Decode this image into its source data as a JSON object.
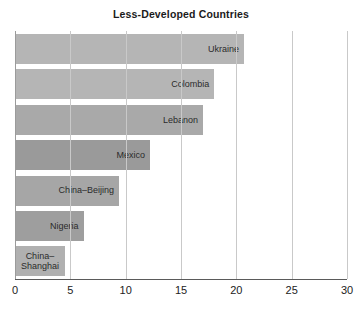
{
  "chart_data": {
    "type": "bar",
    "orientation": "horizontal",
    "title": "Less-Developed Countries",
    "xlabel": "",
    "ylabel": "",
    "xlim": [
      0,
      30
    ],
    "xticks": [
      0,
      5,
      10,
      15,
      20,
      25,
      30
    ],
    "xtick_labels": [
      "0",
      "5",
      "10",
      "15",
      "20",
      "25",
      "30"
    ],
    "grid": true,
    "grid_axis": "x",
    "legend": "none",
    "categories": [
      "Ukraine",
      "Colombia",
      "Lebanon",
      "Mexico",
      "China–Beijing",
      "Nigeria",
      "China–Shanghai"
    ],
    "values": [
      20.7,
      18.0,
      17.0,
      12.2,
      9.4,
      6.2,
      4.5
    ],
    "bars": [
      {
        "label": "Ukraine",
        "value": 20.7,
        "color": "#b5b5b5",
        "label_lines": "Ukraine"
      },
      {
        "label": "Colombia",
        "value": 18.0,
        "color": "#b5b5b5",
        "label_lines": "Colombia"
      },
      {
        "label": "Lebanon",
        "value": 17.0,
        "color": "#a9a9a9",
        "label_lines": "Lebanon"
      },
      {
        "label": "Mexico",
        "value": 12.2,
        "color": "#9a9a9a",
        "label_lines": "Mexico"
      },
      {
        "label": "China–Beijing",
        "value": 9.4,
        "color": "#a6a6a6",
        "label_lines": "China–Beijing"
      },
      {
        "label": "Nigeria",
        "value": 6.2,
        "color": "#9e9e9e",
        "label_lines": "Nigeria"
      },
      {
        "label": "China–Shanghai",
        "value": 4.5,
        "color": "#b0b0b0",
        "label_lines": "China–\nShanghai"
      }
    ],
    "colors": {
      "background": "#ffffff",
      "gridline": "#c9c9c9",
      "axis": "#5a5a5a",
      "title_text": "#1b1b1b",
      "tick_text": "#222222",
      "bar_label_text": "#2b2b2b"
    }
  }
}
